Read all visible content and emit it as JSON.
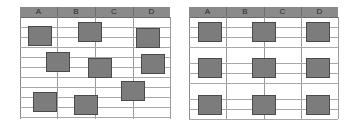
{
  "sheets": [
    {
      "name": "unaligned",
      "left": 20,
      "width": 150,
      "columns": [
        "A",
        "B",
        "C",
        "D"
      ],
      "column_bounds": [
        0,
        37,
        75,
        113,
        150
      ],
      "row_lines": [
        20,
        30,
        40,
        50,
        60,
        70,
        80,
        90,
        100,
        110
      ],
      "shapes": [
        {
          "x": 8,
          "y": 19
        },
        {
          "x": 58,
          "y": 15
        },
        {
          "x": 116,
          "y": 21
        },
        {
          "x": 26,
          "y": 45
        },
        {
          "x": 68,
          "y": 51
        },
        {
          "x": 121,
          "y": 47
        },
        {
          "x": 101,
          "y": 74
        },
        {
          "x": 13,
          "y": 85
        },
        {
          "x": 54,
          "y": 88
        }
      ]
    },
    {
      "name": "aligned",
      "left": 189,
      "width": 149,
      "columns": [
        "A",
        "B",
        "C",
        "D"
      ],
      "column_bounds": [
        0,
        37,
        75,
        112,
        149
      ],
      "row_lines": [
        20,
        30,
        40,
        56,
        66,
        76,
        92,
        102,
        112
      ],
      "shapes": [
        {
          "x": 9,
          "y": 15
        },
        {
          "x": 63,
          "y": 15
        },
        {
          "x": 117,
          "y": 15
        },
        {
          "x": 9,
          "y": 51
        },
        {
          "x": 63,
          "y": 51
        },
        {
          "x": 117,
          "y": 51
        },
        {
          "x": 9,
          "y": 88
        },
        {
          "x": 63,
          "y": 88
        },
        {
          "x": 117,
          "y": 88
        }
      ]
    }
  ],
  "colors": {
    "header": "#8a8a8a",
    "shape_fill": "#7c7c7c",
    "shape_border": "#4a4a4a",
    "grid": "#a8a8a8"
  }
}
